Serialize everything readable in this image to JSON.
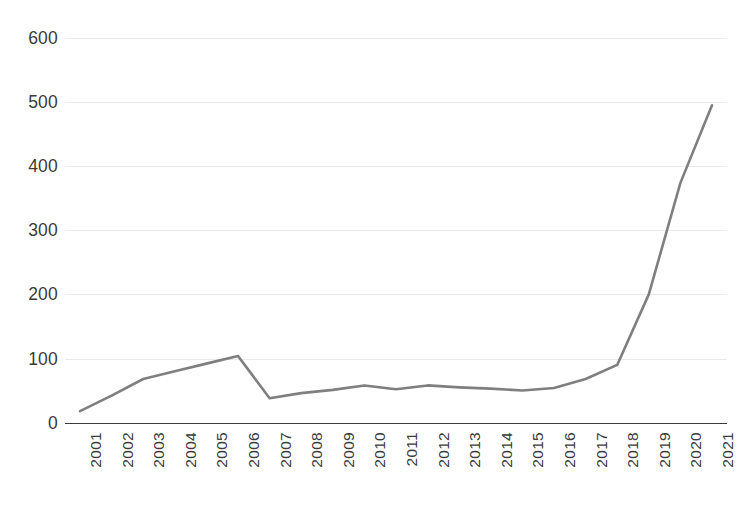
{
  "chart_data": {
    "type": "line",
    "title": "",
    "xlabel": "",
    "ylabel": "",
    "categories": [
      "2001",
      "2002",
      "2003",
      "2004",
      "2005",
      "2006",
      "2007",
      "2008",
      "2009",
      "2010",
      "2011",
      "2012",
      "2013",
      "2014",
      "2015",
      "2016",
      "2017",
      "2018",
      "2019",
      "2020",
      "2021"
    ],
    "series": [
      {
        "name": "series-1",
        "color": "#7f7f7f",
        "values": [
          18,
          42,
          68,
          80,
          92,
          104,
          38,
          46,
          51,
          58,
          52,
          58,
          55,
          53,
          50,
          54,
          68,
          90,
          200,
          374,
          495
        ]
      }
    ],
    "ylim": [
      0,
      600
    ],
    "yticks": [
      0,
      100,
      200,
      300,
      400,
      500,
      600
    ],
    "ytick_labels": [
      "0",
      "100",
      "200",
      "300",
      "400",
      "500",
      "600"
    ],
    "grid": true,
    "grid_axis": "y",
    "legend": false,
    "xtick_rotation": 90
  },
  "style": {
    "line_color": "#7f7f7f",
    "grid_color": "#e9e9ef",
    "axis_color": "#3a3a3a",
    "text_color": "#3b3b3b",
    "background": "#ffffff"
  },
  "header": {
    "clipped_title": ""
  }
}
